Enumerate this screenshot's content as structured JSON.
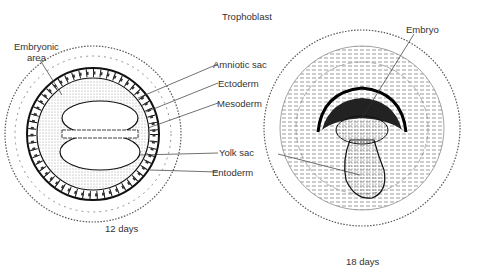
{
  "title": "Trophoblast",
  "left_diagram": {
    "caption": "12 days",
    "labels": {
      "embryonic_area": [
        "Embryonic",
        "area"
      ],
      "amniotic_sac": "Amniotic sac",
      "ectoderm": "Ectoderm",
      "mesoderm": "Mesoderm",
      "yolk_sac": "Yolk sac",
      "entoderm": "Entoderm"
    }
  },
  "right_diagram": {
    "caption": "18 days",
    "labels": {
      "embryo": "Embryo"
    }
  }
}
